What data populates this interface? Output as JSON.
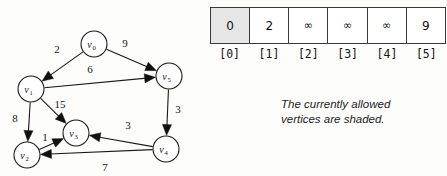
{
  "figure": {
    "type": "weighted-directed-graph-with-distance-array",
    "caption_line1": "The currently allowed",
    "caption_line2": "vertices are shaded."
  },
  "graph": {
    "vertices": [
      {
        "id": "v0",
        "base": "v",
        "sub": "0",
        "cx": 94,
        "cy": 44,
        "r": 13
      },
      {
        "id": "v1",
        "base": "v",
        "sub": "1",
        "cx": 31,
        "cy": 89,
        "r": 13
      },
      {
        "id": "v2",
        "base": "v",
        "sub": "2",
        "cx": 27,
        "cy": 155,
        "r": 13
      },
      {
        "id": "v3",
        "base": "v",
        "sub": "3",
        "cx": 76,
        "cy": 133,
        "r": 13
      },
      {
        "id": "v4",
        "base": "v",
        "sub": "4",
        "cx": 166,
        "cy": 149,
        "r": 13
      },
      {
        "id": "v5",
        "base": "v",
        "sub": "5",
        "cx": 169,
        "cy": 76,
        "r": 13
      }
    ],
    "edges": [
      {
        "from": "v0",
        "to": "v1",
        "weight": "2",
        "lx": 57,
        "ly": 53
      },
      {
        "from": "v0",
        "to": "v5",
        "weight": "9",
        "lx": 125,
        "ly": 47
      },
      {
        "from": "v1",
        "to": "v5",
        "weight": "6",
        "lx": 90,
        "ly": 73
      },
      {
        "from": "v1",
        "to": "v2",
        "weight": "8",
        "lx": 15,
        "ly": 122
      },
      {
        "from": "v1",
        "to": "v3",
        "weight": "15",
        "lx": 60,
        "ly": 108
      },
      {
        "from": "v2",
        "to": "v3",
        "weight": "1",
        "lx": 45,
        "ly": 141
      },
      {
        "from": "v5",
        "to": "v4",
        "weight": "3",
        "lx": 178,
        "ly": 113
      },
      {
        "from": "v4",
        "to": "v3",
        "weight": "3",
        "lx": 128,
        "ly": 129
      },
      {
        "from": "v4",
        "to": "v2",
        "weight": "7",
        "lx": 105,
        "ly": 171
      }
    ]
  },
  "table": {
    "label": "distance",
    "cells": [
      {
        "value": "0",
        "shaded": true
      },
      {
        "value": "2",
        "shaded": false
      },
      {
        "value": "∞",
        "shaded": false
      },
      {
        "value": "∞",
        "shaded": false
      },
      {
        "value": "∞",
        "shaded": false
      },
      {
        "value": "9",
        "shaded": false
      }
    ],
    "indices": [
      "[0]",
      "[1]",
      "[2]",
      "[3]",
      "[4]",
      "[5]"
    ]
  },
  "colors": {
    "shade": "#e6e6e6",
    "ink": "#141414",
    "background": "#fdfdfc"
  }
}
